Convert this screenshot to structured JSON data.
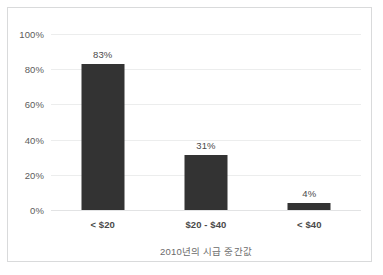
{
  "chart_data": {
    "type": "bar",
    "title": "",
    "xlabel": "2010년의 시급 중간값",
    "ylabel": "",
    "categories": [
      "< $20",
      "$20 - $40",
      "< $40"
    ],
    "values": [
      83,
      31,
      4
    ],
    "value_labels": [
      "83%",
      "31%",
      "4%"
    ],
    "ylim": [
      0,
      100
    ],
    "yticks": [
      0,
      20,
      40,
      60,
      80,
      100
    ],
    "ytick_labels": [
      "0%",
      "20%",
      "40%",
      "60%",
      "80%",
      "100%"
    ],
    "grid": true,
    "legend": false,
    "bar_color": "#333333",
    "gridline_color": "#eceded",
    "background_color": "#ffffff",
    "border_color": "#d9dadb"
  }
}
